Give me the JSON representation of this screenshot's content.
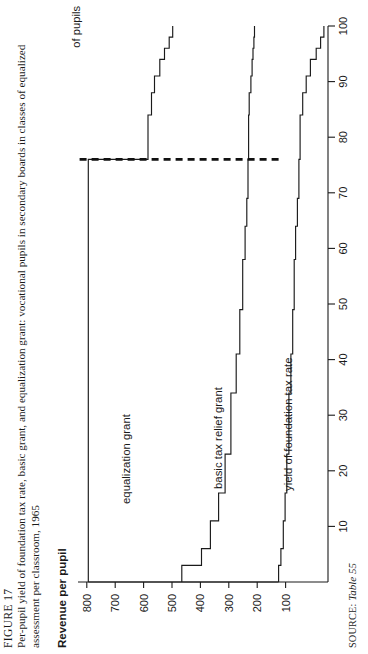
{
  "figure": {
    "number": "FIGURE 17",
    "caption": "Per-pupil yield of foundation tax rate, basic grant, and equalization grant: vocational pupils in secondary boards in classes of equalized assessment per classroom, 1965",
    "source_prefix": "SOURCE:",
    "source_ref": "Table 55"
  },
  "axes": {
    "y_title": "Revenue per pupil",
    "x_title_line1": "Per cent",
    "x_title_line2": "of pupils",
    "y_ticks": [
      "800",
      "700",
      "600",
      "500",
      "400",
      "300",
      "200",
      "100"
    ],
    "x_ticks": [
      "10",
      "20",
      "30",
      "40",
      "50",
      "60",
      "70",
      "80",
      "90",
      "100"
    ]
  },
  "series_labels": {
    "equalization": "equalization grant",
    "basic": "basic tax relief grant",
    "foundation": "yield of foundation tax rate"
  },
  "chart_data": {
    "type": "area",
    "title": "Per-pupil yield of foundation tax rate, basic grant, and equalization grant: vocational pupils in secondary boards in classes of equalized assessment per classroom, 1965",
    "xlabel": "Per cent of pupils",
    "ylabel": "Revenue per pupil",
    "xlim": [
      0,
      100
    ],
    "ylim": [
      0,
      850
    ],
    "grid": false,
    "legend": "inline annotations",
    "note": "Cumulative step (staircase) chart. Boundaries are cumulative revenue per pupil; bands between consecutive boundaries are the three revenue components. A heavy dashed vertical reference line is drawn at 76 per cent of pupils.",
    "reference_line_x": 76,
    "x_breaks": [
      0,
      3,
      6,
      11,
      16,
      23,
      34,
      41,
      49,
      58,
      64,
      69,
      76,
      84,
      88,
      91,
      94,
      96,
      98,
      100
    ],
    "series": [
      {
        "name": "yield of foundation tax rate",
        "role": "lower boundary (cumulative level 1)",
        "values": [
          168,
          160,
          152,
          146,
          140,
          133,
          126,
          120,
          115,
          110,
          104,
          99,
          95,
          86,
          74,
          60,
          40,
          25,
          14,
          14
        ]
      },
      {
        "name": "basic tax relief grant",
        "role": "middle boundary (cumulative level 2)",
        "values": [
          497,
          430,
          400,
          372,
          350,
          330,
          312,
          300,
          290,
          282,
          276,
          272,
          270,
          268,
          262,
          258,
          255,
          252,
          250,
          250
        ]
      },
      {
        "name": "equalization grant",
        "role": "upper boundary (cumulative total revenue)",
        "values": [
          815,
          815,
          815,
          815,
          815,
          815,
          815,
          815,
          815,
          815,
          815,
          815,
          612,
          600,
          590,
          572,
          556,
          540,
          528,
          528
        ]
      }
    ]
  }
}
